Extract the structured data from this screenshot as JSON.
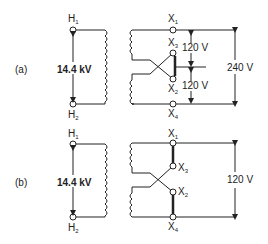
{
  "diagram": {
    "panels": [
      {
        "label": "(a)",
        "primary_voltage": "14.4 kV",
        "primary_terminals": [
          "H",
          "H"
        ],
        "primary_subs": [
          "1",
          "2"
        ],
        "secondary_terminals": [
          "X",
          "X",
          "X",
          "X"
        ],
        "secondary_subs": [
          "1",
          "3",
          "2",
          "4"
        ],
        "upper_voltage": "120 V",
        "lower_voltage": "120 V",
        "total_voltage": "240 V",
        "connection": "series"
      },
      {
        "label": "(b)",
        "primary_voltage": "14.4 kV",
        "primary_terminals": [
          "H",
          "H"
        ],
        "primary_subs": [
          "1",
          "2"
        ],
        "secondary_terminals": [
          "X",
          "X",
          "X",
          "X"
        ],
        "secondary_subs": [
          "1",
          "3",
          "2",
          "4"
        ],
        "total_voltage": "120 V",
        "connection": "parallel"
      }
    ],
    "colors": {
      "line": "#222222",
      "background": "#ffffff"
    }
  }
}
